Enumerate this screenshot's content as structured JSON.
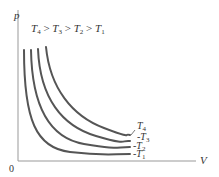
{
  "diagram": {
    "axis_y_label": "p",
    "axis_x_label": "V",
    "origin_label": "0",
    "relation": {
      "parts": [
        "T",
        "4",
        " > ",
        "T",
        "3",
        " > ",
        "T",
        "2",
        " > ",
        "T",
        "1"
      ],
      "text": "T4 > T3 > T2 > T1"
    },
    "curves": [
      {
        "name": "T4",
        "label_main": "T",
        "label_sub": "4",
        "leader": "/",
        "color": "#555555"
      },
      {
        "name": "T3",
        "label_main": "T",
        "label_sub": "3",
        "leader": "-",
        "color": "#555555"
      },
      {
        "name": "T2",
        "label_main": "T",
        "label_sub": "2",
        "leader": "-",
        "color": "#555555"
      },
      {
        "name": "T1",
        "label_main": "T",
        "label_sub": "1",
        "leader": "-",
        "color": "#555555"
      }
    ],
    "colors": {
      "axis": "#999999",
      "curve": "#555555",
      "text": "#333333"
    }
  }
}
